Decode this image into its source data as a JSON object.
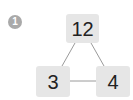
{
  "problem": {
    "number": "1",
    "badge_color": "#a9a9a9"
  },
  "diagram": {
    "box_color": "#e6e6e6",
    "line_color": "#9a9a9a",
    "nodes": {
      "top": "12",
      "left": "3",
      "right": "4"
    },
    "edges": [
      [
        "top",
        "left"
      ],
      [
        "top",
        "right"
      ],
      [
        "left",
        "right"
      ]
    ]
  }
}
